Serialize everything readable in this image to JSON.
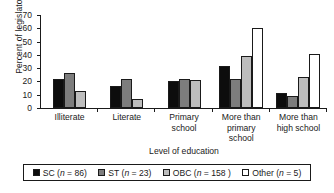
{
  "chart_data": {
    "type": "bar",
    "title": "",
    "xlabel": "Level of education",
    "ylabel": "Percent of legislators",
    "ylim": [
      0,
      70
    ],
    "yticks": [
      70,
      60,
      50,
      40,
      30,
      20,
      10,
      0
    ],
    "grid": false,
    "legend_position": "bottom",
    "categories": [
      "Illiterate",
      "Literate",
      "Primary school",
      "More than primary school",
      "More than high school"
    ],
    "category_lines": [
      [
        "Illiterate"
      ],
      [
        "Literate"
      ],
      [
        "Primary",
        "school"
      ],
      [
        "More than",
        "primary",
        "school"
      ],
      [
        "More than",
        "high school"
      ]
    ],
    "series": [
      {
        "name": "SC",
        "n": 86,
        "color": "#0d0d0d",
        "values": [
          22,
          16.5,
          20,
          32,
          11
        ]
      },
      {
        "name": "ST",
        "n": 23,
        "color": "#7d7d7d",
        "values": [
          26.5,
          21.5,
          21.5,
          22,
          9
        ]
      },
      {
        "name": "OBC",
        "n": 158,
        "color": "#bdbdbd",
        "values": [
          12.5,
          7,
          21,
          39,
          23.5
        ]
      },
      {
        "name": "Other",
        "n": 5,
        "color": "#ffffff",
        "values": [
          0,
          0,
          0,
          60.5,
          41
        ]
      }
    ],
    "legend_labels": [
      "SC (n = 86)",
      "ST (n = 23)",
      "OBC (n = 158 )",
      "Other (n = 5)"
    ],
    "legend_parts": [
      {
        "name": "SC",
        "open": "(",
        "italic": "n",
        "rest": " = 86)"
      },
      {
        "name": "ST",
        "open": "(",
        "italic": "n",
        "rest": " = 23)"
      },
      {
        "name": "OBC",
        "open": "(",
        "italic": "n",
        "rest": " = 158 )"
      },
      {
        "name": "Other",
        "open": "(",
        "italic": "n",
        "rest": " = 5)"
      }
    ]
  }
}
